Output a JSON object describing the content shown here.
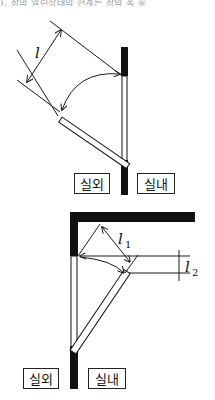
{
  "header": {
    "text": "), 창의 열린상태의 한계는 창의 폭 ⑥"
  },
  "diagram_top": {
    "dimension_label": "l",
    "outside_label": "실외",
    "inside_label": "실내"
  },
  "diagram_bottom": {
    "dimension_label_1": "l",
    "dimension_label_1_sub": "1",
    "dimension_label_2": "l",
    "dimension_label_2_sub": "2",
    "outside_label": "실외",
    "inside_label": "실내"
  },
  "colors": {
    "wall": "#111111",
    "line": "#1a1a1a",
    "background": "#ffffff"
  }
}
